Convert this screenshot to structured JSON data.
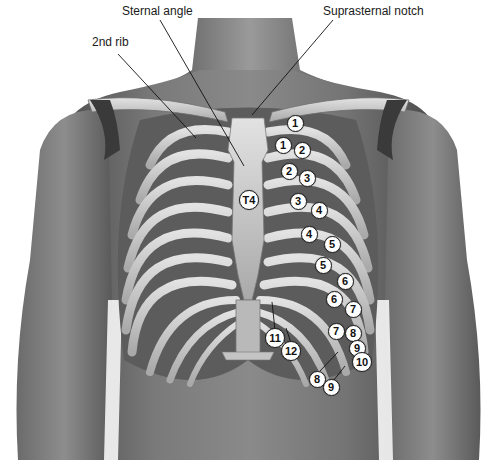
{
  "figure": {
    "callouts": [
      {
        "id": "sternal-angle",
        "text": "Sternal angle",
        "x": 122,
        "y": 12
      },
      {
        "id": "suprasternal-notch",
        "text": "Suprasternal notch",
        "x": 323,
        "y": 12
      },
      {
        "id": "second-rib",
        "text": "2nd rib",
        "x": 92,
        "y": 43
      }
    ],
    "markers": [
      {
        "text": "1",
        "x": 295,
        "y": 123,
        "kind": "rib"
      },
      {
        "text": "1",
        "x": 283,
        "y": 145,
        "kind": "interspace"
      },
      {
        "text": "2",
        "x": 302,
        "y": 150,
        "kind": "rib"
      },
      {
        "text": "2",
        "x": 289,
        "y": 171,
        "kind": "interspace"
      },
      {
        "text": "3",
        "x": 307,
        "y": 178,
        "kind": "rib"
      },
      {
        "text": "T4",
        "x": 249,
        "y": 200,
        "kind": "vertebra"
      },
      {
        "text": "3",
        "x": 298,
        "y": 201,
        "kind": "interspace"
      },
      {
        "text": "4",
        "x": 319,
        "y": 210,
        "kind": "rib"
      },
      {
        "text": "4",
        "x": 309,
        "y": 234,
        "kind": "interspace"
      },
      {
        "text": "5",
        "x": 332,
        "y": 244,
        "kind": "rib"
      },
      {
        "text": "5",
        "x": 323,
        "y": 265,
        "kind": "interspace"
      },
      {
        "text": "6",
        "x": 345,
        "y": 281,
        "kind": "rib"
      },
      {
        "text": "6",
        "x": 334,
        "y": 299,
        "kind": "interspace"
      },
      {
        "text": "7",
        "x": 353,
        "y": 309,
        "kind": "rib"
      },
      {
        "text": "7",
        "x": 336,
        "y": 331,
        "kind": "interspace"
      },
      {
        "text": "8",
        "x": 353,
        "y": 333,
        "kind": "rib"
      },
      {
        "text": "9",
        "x": 357,
        "y": 348,
        "kind": "rib"
      },
      {
        "text": "10",
        "x": 362,
        "y": 362,
        "kind": "rib"
      },
      {
        "text": "8",
        "x": 317,
        "y": 379,
        "kind": "interspace"
      },
      {
        "text": "9",
        "x": 331,
        "y": 387,
        "kind": "interspace"
      },
      {
        "text": "11",
        "x": 275,
        "y": 338,
        "kind": "rib"
      },
      {
        "text": "12",
        "x": 291,
        "y": 351,
        "kind": "rib"
      }
    ],
    "colors": {
      "background": "#ffffff",
      "skin_dark": "#5a5a5a",
      "skin_mid": "#7d7d7d",
      "bone": "#cfcfcf",
      "bone_shadow": "#8f8f8f",
      "marker_fill": "#ffffff",
      "leader_line": "#111111"
    }
  }
}
